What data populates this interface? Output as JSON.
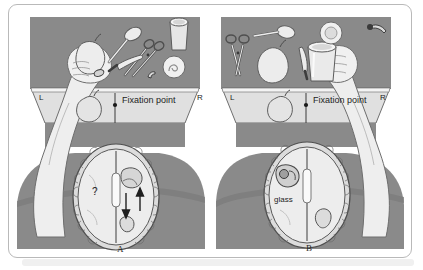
{
  "figure": {
    "panels": [
      {
        "id": "A",
        "caption": "A",
        "screen": {
          "left_field_label": "L",
          "right_field_label": "R",
          "center_label": "Fixation point",
          "projected_object": "pear"
        },
        "table_objects": [
          "pear",
          "spoon",
          "scissors",
          "knife",
          "glass",
          "button",
          "nail",
          "disc"
        ],
        "hand": {
          "side": "left",
          "action": "grasping pear behind screen"
        },
        "brain": {
          "left_hemisphere_label": "?",
          "right_hemisphere_label": "",
          "arrows": "two vertical arrows in right hemisphere",
          "corpus_callosum": "severed"
        }
      },
      {
        "id": "B",
        "caption": "B",
        "screen": {
          "left_field_label": "L",
          "right_field_label": "R",
          "center_label": "Fixation point",
          "projected_object": "pear"
        },
        "table_objects": [
          "scissors",
          "spoon",
          "pear",
          "knife",
          "disc",
          "glass",
          "nail"
        ],
        "hand": {
          "side": "right",
          "action": "grasping glass"
        },
        "brain": {
          "left_hemisphere_label": "glass",
          "right_hemisphere_label": "",
          "arrows": "",
          "corpus_callosum": "severed"
        }
      }
    ],
    "colors": {
      "table_gray": "#8a8a8a",
      "skin": "#ececec",
      "screen": "#e2e2e2",
      "brain_fill": "#e9e9e9",
      "frame_border": "#b9b9b9",
      "text": "#1d1d1d"
    }
  }
}
